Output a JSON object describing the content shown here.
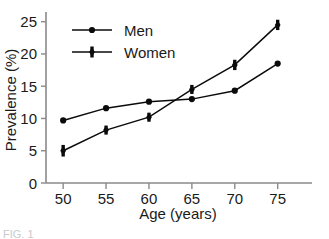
{
  "chart_data": {
    "type": "line",
    "title": "",
    "xlabel": "Age (years)",
    "ylabel": "Prevalence (%)",
    "x": [
      50,
      55,
      60,
      65,
      70,
      75
    ],
    "xlim": [
      48,
      79
    ],
    "ylim": [
      0,
      26.5
    ],
    "xticks": [
      50,
      55,
      60,
      65,
      70,
      75
    ],
    "yticks": [
      0,
      5,
      10,
      15,
      20,
      25
    ],
    "xticklabels": [
      "50",
      "55",
      "60",
      "65",
      "70",
      "75"
    ],
    "yticklabels": [
      "0",
      "5",
      "10",
      "15",
      "20",
      "25"
    ],
    "grid": false,
    "legend_position": "upper-left-inside",
    "series": [
      {
        "name": "Men",
        "marker": "circle",
        "values": [
          9.7,
          11.6,
          12.6,
          13.0,
          14.3,
          18.5
        ],
        "errors": [
          0.0,
          0.0,
          0.0,
          0.0,
          0.0,
          0.0
        ]
      },
      {
        "name": "Women",
        "marker": "diamond",
        "values": [
          5.0,
          8.2,
          10.2,
          14.5,
          18.3,
          24.5
        ],
        "errors": [
          0.9,
          0.7,
          0.7,
          0.7,
          0.8,
          0.8
        ]
      }
    ]
  },
  "legend": {
    "entries": [
      {
        "label": "Men"
      },
      {
        "label": "Women"
      }
    ]
  },
  "caption": {
    "text": "FIG. 1"
  },
  "colors": {
    "series": "#0b0b0b",
    "axis": "#8a8a8a",
    "text": "#1a1a1a",
    "background": "#ffffff"
  }
}
